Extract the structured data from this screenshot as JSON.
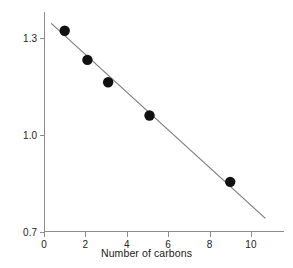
{
  "chart_data": {
    "type": "scatter",
    "title": "",
    "xlabel": "Number of carbons",
    "ylabel": "Log solubility (mg/ml)",
    "ylabel_prefix": "Log solubility (mg/m",
    "ylabel_italic": "l",
    "ylabel_suffix": ")",
    "xlim": [
      0,
      11.6
    ],
    "ylim": [
      0.7,
      1.38
    ],
    "xticks": [
      0,
      2,
      4,
      6,
      8,
      10
    ],
    "xtick_labels": [
      "0",
      "2",
      "4",
      "6",
      "8",
      "10"
    ],
    "yticks": [
      0.7,
      1.0,
      1.3
    ],
    "ytick_labels": [
      "0.7",
      "1.0",
      "1.3"
    ],
    "grid": false,
    "legend": "none",
    "point_color": "#111111",
    "line_color": "#777777",
    "axis_color": "#8c8c8c",
    "x": [
      1.0,
      2.1,
      3.1,
      5.1,
      9.0
    ],
    "y": [
      1.322,
      1.232,
      1.163,
      1.06,
      0.855
    ],
    "points": [
      {
        "x": 1.0,
        "y": 1.322
      },
      {
        "x": 2.1,
        "y": 1.232
      },
      {
        "x": 3.1,
        "y": 1.163
      },
      {
        "x": 5.1,
        "y": 1.06
      },
      {
        "x": 9.0,
        "y": 0.855
      }
    ],
    "fit_line": {
      "x_start": 0.35,
      "y_start": 1.345,
      "x_end": 10.7,
      "y_end": 0.742
    }
  }
}
